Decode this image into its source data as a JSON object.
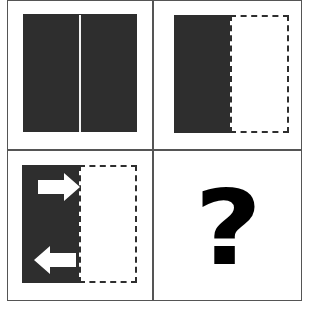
{
  "puzzle": {
    "layout": "2x2 grid",
    "colors": {
      "dark_fill": "#2e2e2e",
      "grid_line": "#555555",
      "background": "#ffffff"
    },
    "panels": [
      {
        "id": 1,
        "description": "dark square divided by a thin white vertical line at center"
      },
      {
        "id": 2,
        "description": "left half dark, right half white with dashed outline"
      },
      {
        "id": 3,
        "description": "left half dark, right half white with dashed outline; right arrow at top, left arrow at bottom",
        "arrows": [
          "right",
          "left"
        ]
      },
      {
        "id": 4,
        "description": "unknown answer",
        "symbol": "?"
      }
    ]
  }
}
